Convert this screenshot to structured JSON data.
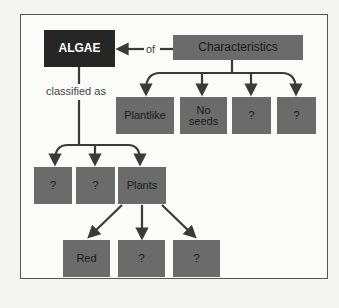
{
  "diagram": {
    "root": "ALGAE",
    "link_of": "of",
    "link_classified": "classified as",
    "characteristics": {
      "label": "Characteristics",
      "children": [
        "Plantlike",
        "No\nseeds",
        "?",
        "?"
      ]
    },
    "classification": {
      "children": [
        "?",
        "?",
        "Plants"
      ]
    },
    "plants": {
      "children": [
        "Red",
        "?",
        "?"
      ]
    },
    "colors": {
      "root": "#262626",
      "node": "#6b6b6b",
      "line": "#3a3a3a"
    }
  }
}
